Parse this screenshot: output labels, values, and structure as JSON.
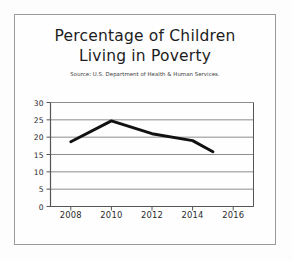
{
  "chart_data": {
    "type": "line",
    "title": "Percentage of Children Living in Poverty",
    "title_lines": [
      "Percentage of Children",
      "Living in Poverty"
    ],
    "subtitle": "Source: U.S. Department of Health & Human Services.",
    "xlabel": "",
    "ylabel": "",
    "x": [
      2008,
      2010,
      2012,
      2014,
      2015
    ],
    "values": [
      18.7,
      24.7,
      21.0,
      19.0,
      15.8
    ],
    "series": [
      {
        "name": "Percentage of children living in poverty",
        "values": [
          18.7,
          24.7,
          21.0,
          19.0,
          15.8
        ]
      }
    ],
    "xlim": [
      2007,
      2017
    ],
    "ylim": [
      0,
      30
    ],
    "ytick_labels": [
      "0",
      "5",
      "10",
      "15",
      "20",
      "25",
      "30"
    ],
    "ytick_values": [
      0,
      5,
      10,
      15,
      20,
      25,
      30
    ],
    "xtick_labels": [
      "2008",
      "2010",
      "2012",
      "2014",
      "2016"
    ],
    "xtick_values": [
      2008,
      2010,
      2012,
      2014,
      2016
    ],
    "grid": "horizontal",
    "legend": "none",
    "line_color": "#111111",
    "grid_color": "#8c8c8c",
    "axis_color": "#555555",
    "background_color": "#fefefe",
    "frame_color": "#9a9a9a"
  }
}
